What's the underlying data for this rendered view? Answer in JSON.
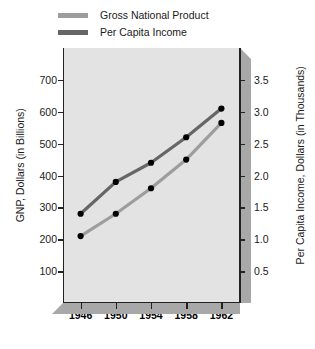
{
  "legend": {
    "position": "top-left",
    "items": [
      {
        "label": "Gross National Product",
        "color": "#9d9d9d",
        "key": "gnp"
      },
      {
        "label": "Per Capita Income",
        "color": "#666666",
        "key": "pci"
      }
    ]
  },
  "axes": {
    "left": {
      "title": "GNP, Dollars (in Billions)",
      "ticks": [
        "100",
        "200",
        "300",
        "400",
        "500",
        "600",
        "700"
      ],
      "min": 0,
      "max": 800
    },
    "right": {
      "title": "Per Capita Income, Dollars (in Thousands)",
      "ticks": [
        "0.5",
        "1.0",
        "1.5",
        "2.0",
        "2.5",
        "3.0",
        "3.5"
      ],
      "min": 0,
      "max": 4.0
    },
    "bottom": {
      "title": "",
      "ticks": [
        "1946",
        "1950",
        "1954",
        "1958",
        "1962"
      ]
    }
  },
  "chart_data": {
    "type": "line",
    "title": "",
    "xlabel": "",
    "ylabel": "GNP, Dollars (in Billions)",
    "y2label": "Per Capita Income, Dollars (in Thousands)",
    "x": [
      "1946",
      "1950",
      "1954",
      "1958",
      "1962"
    ],
    "categories": [
      "1946",
      "1950",
      "1954",
      "1958",
      "1962"
    ],
    "grid": false,
    "legend_position": "top-left",
    "ylim": [
      0,
      800
    ],
    "y2lim": [
      0,
      4.0
    ],
    "series": [
      {
        "name": "Gross National Product",
        "axis": "left",
        "units": "Billions of Dollars",
        "color": "#9d9d9d",
        "marker": "circle",
        "marker_color": "#000000",
        "values": [
          210,
          280,
          360,
          450,
          565
        ]
      },
      {
        "name": "Per Capita Income",
        "axis": "right",
        "units": "Thousands of Dollars",
        "color": "#666666",
        "marker": "circle",
        "marker_color": "#000000",
        "values": [
          1.4,
          1.9,
          2.2,
          2.6,
          3.05
        ]
      }
    ]
  }
}
